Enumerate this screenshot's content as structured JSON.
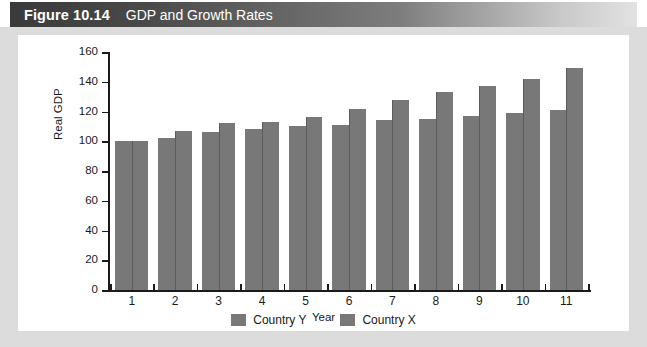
{
  "figure": {
    "number": "Figure 10.14",
    "title": "GDP and Growth Rates"
  },
  "colors": {
    "bar": "#787878",
    "bar_edge": "#5c5c5c",
    "axis": "#1a1a1a",
    "frame": "#dcdcdc",
    "titlebar_dark": "#3a3a3a",
    "titlebar_light": "#e2e2e2",
    "title_text": "#ffffff"
  },
  "chart_data": {
    "type": "bar",
    "title": "GDP and Growth Rates",
    "xlabel": "Year",
    "ylabel": "Real GDP",
    "categories": [
      "1",
      "2",
      "3",
      "4",
      "5",
      "6",
      "7",
      "8",
      "9",
      "10",
      "11"
    ],
    "series": [
      {
        "name": "Country Y",
        "values": [
          100,
          102,
          106,
          108,
          110,
          111,
          114,
          115,
          117,
          119,
          121
        ]
      },
      {
        "name": "Country X",
        "values": [
          100,
          107,
          112,
          113,
          116,
          122,
          128,
          133,
          137,
          142,
          149
        ]
      }
    ],
    "ylim": [
      0,
      160
    ],
    "yticks": [
      0,
      20,
      40,
      60,
      80,
      100,
      120,
      140,
      160
    ],
    "ytick_labels": [
      "0",
      "20",
      "40",
      "60",
      "80",
      "100",
      "120",
      "140",
      "160"
    ],
    "grid": false,
    "legend_position": "bottom-center",
    "legend_entries": [
      "Country Y",
      "Country X"
    ]
  }
}
